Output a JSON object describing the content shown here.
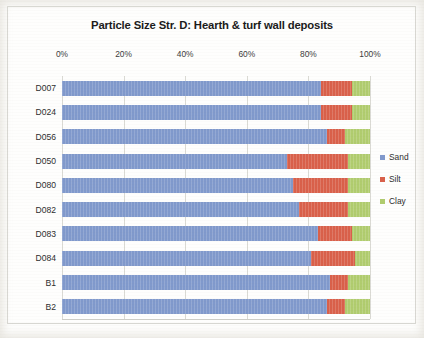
{
  "chart_data": {
    "type": "bar",
    "orientation": "horizontal",
    "stacked": true,
    "stack_mode": "percent",
    "title": "Particle Size Str. D: Hearth & turf wall deposits",
    "xlabel": "",
    "ylabel": "",
    "xlim": [
      0,
      100
    ],
    "xtick_labels": [
      "0%",
      "20%",
      "40%",
      "60%",
      "80%",
      "100%"
    ],
    "xticks": [
      0,
      20,
      40,
      60,
      80,
      100
    ],
    "grid": true,
    "legend_position": "right",
    "categories": [
      "D007",
      "D024",
      "D056",
      "D050",
      "D080",
      "D082",
      "D083",
      "D084",
      "B1",
      "B2"
    ],
    "series": [
      {
        "name": "Sand",
        "color": "#8099cc",
        "values": [
          84,
          84,
          86,
          73,
          75,
          77,
          83,
          81,
          87,
          86
        ]
      },
      {
        "name": "Silt",
        "color": "#d9604a",
        "values": [
          10,
          10,
          6,
          20,
          18,
          16,
          11,
          14,
          6,
          6
        ]
      },
      {
        "name": "Clay",
        "color": "#b0cc6e",
        "values": [
          6,
          6,
          8,
          7,
          7,
          7,
          6,
          5,
          7,
          8
        ]
      }
    ]
  }
}
